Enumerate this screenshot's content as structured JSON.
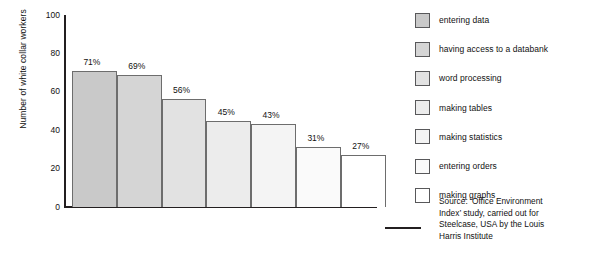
{
  "chart_data": {
    "type": "bar",
    "title": "",
    "subtitle": "",
    "xlabel": "",
    "ylabel": "Number of white collar workers",
    "ylim": [
      0,
      100
    ],
    "yticks": [
      0,
      20,
      40,
      60,
      80,
      100
    ],
    "ytick_labels": [
      "0",
      "20",
      "40",
      "60",
      "80",
      "100"
    ],
    "grid": false,
    "legend_position": "right",
    "categories": [
      "entering data",
      "having access to a databank",
      "word processing",
      "making tables",
      "making statistics",
      "entering orders",
      "making graphs"
    ],
    "values": [
      71,
      69,
      56,
      45,
      43,
      31,
      27
    ],
    "data_labels": [
      "71%",
      "69%",
      "56%",
      "45%",
      "43%",
      "31%",
      "27%"
    ],
    "bar_colors": [
      "#c9c9c9",
      "#d5d5d5",
      "#e2e2e2",
      "#ececec",
      "#f4f4f4",
      "#fafafa",
      "#ffffff"
    ],
    "bar_edge_color": "#6d6d6d",
    "axis_color": "#231f20",
    "annotations": [
      "Source: 'Office Environment Index' study, carried out for Steelcase, USA by the Louis Harris Institute"
    ]
  },
  "legend": {
    "items": [
      {
        "label": "entering data",
        "color": "#c9c9c9"
      },
      {
        "label": "having access to a databank",
        "color": "#d5d5d5"
      },
      {
        "label": "word processing",
        "color": "#e2e2e2"
      },
      {
        "label": "making tables",
        "color": "#ececec"
      },
      {
        "label": "making statistics",
        "color": "#f4f4f4"
      },
      {
        "label": "entering orders",
        "color": "#fafafa"
      },
      {
        "label": "making graphs",
        "color": "#ffffff"
      }
    ]
  },
  "source": {
    "line1": "Source: ‘Office Environment",
    "line2": "Index’ study, carried out for",
    "line3": "Steelcase, USA by the Louis",
    "line4": "Harris Institute"
  }
}
